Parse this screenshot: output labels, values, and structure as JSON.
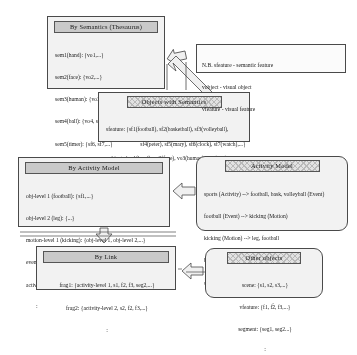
{
  "note": {
    "name": "legend-note",
    "lines": [
      "N.B. sfeature - semantic feature",
      "vobject - visual object",
      "vfeature - visual feature"
    ]
  },
  "boxes": {
    "semantics": {
      "header": "By Semantics (Thesaurus)",
      "rows": [
        "sem1(hand): {vo1,...}",
        "sem2(face): {vo2,...}",
        "sem3(human): {vo3, sf4, sf5,...}",
        "sem4(ball): {vo4, sf1, sf2, sf3,...}",
        "sem5(timer): {sf6, sf7,...}"
      ],
      "ellipsis": ":"
    },
    "objects_with_semantics": {
      "header": "Objects with Semantics",
      "rows": [
        "sfeature: {sf1(football), sf2(basketball), sf3(volleyball),",
        "sf4(peter), sf5(mary), sf6(clock), sf7(watch),...}",
        "vobject: {vo1(hand), vo2(face), vo3(human), vo4(ball),...}"
      ]
    },
    "by_activity_model": {
      "header": "By Activity Model",
      "rows": [
        "obj-level 1 (football): {sf1,...}",
        "obj-level 2 (leg): {...}",
        "motion-level 1 (kicking): {obj-level 1, obj-level 2,...}",
        "event-level 1 (football): {motion-level 1,...}",
        "activity-level 1 (sports): {event-level 1,...}"
      ],
      "ellipsis": ":"
    },
    "activity_model": {
      "header": "Activity Model",
      "rows": [
        "sports (Activity) --> football, bask, volleyball (Event)",
        "football (Event) --> kicking (Motion)",
        "kicking (Motion) --> leg, football",
        "basketball (Event) --> slam-dunk",
        "slam-dunk (Motion) --> hand, basketball"
      ],
      "ellipsis": ":"
    },
    "by_link": {
      "header": "By Link",
      "rows": [
        "frag1: {activity-level 1, s1, f2, f3, seg2,...}",
        "frag2: {activity-level 2, s2, f2, f3,...}"
      ],
      "ellipsis": ":"
    },
    "other_objects": {
      "header": "Other objects",
      "rows": [
        "scene: {s1, s2, s3,...}",
        "vfeature: {f1, f2, f3,...}",
        "segment: {seg1, seg2...}"
      ],
      "ellipsis": ":"
    }
  },
  "arrows": [
    {
      "name": "objects-to-semantics-upper",
      "direction": "up-left"
    },
    {
      "name": "objects-to-semantics-lower",
      "direction": "up-left"
    },
    {
      "name": "activity-model-to-by-activity-model",
      "direction": "left"
    },
    {
      "name": "by-activity-model-to-by-link",
      "direction": "down"
    },
    {
      "name": "other-objects-to-by-link",
      "direction": "left"
    }
  ],
  "colors": {
    "box_fill": "#f2f2f0",
    "header_fill": "#c9c9c7",
    "outline": "#4a4a4a",
    "page": "#ffffff"
  }
}
